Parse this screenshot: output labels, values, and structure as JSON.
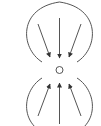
{
  "diagram": {
    "title": "",
    "colors": {
      "stroke": "#555555",
      "background": "#ffffff"
    },
    "center": {
      "x": 59.5,
      "y": 70,
      "r": 3.5
    },
    "top_lobe": {
      "path": "M 42 62 C 20 48, 18 8, 59.5 2 C 101 8, 99 48, 77 62",
      "arrows": [
        {
          "x1": 38,
          "y1": 24,
          "x2": 50,
          "y2": 57
        },
        {
          "x1": 59.5,
          "y1": 18,
          "x2": 59.5,
          "y2": 58
        },
        {
          "x1": 81,
          "y1": 24,
          "x2": 69,
          "y2": 57
        }
      ]
    },
    "bottom_lobe": {
      "path": "M 42 78 C 20 92, 18 132, 59.5 138 C 101 132, 99 92, 77 78",
      "arrows": [
        {
          "x1": 38,
          "y1": 116,
          "x2": 50,
          "y2": 84
        },
        {
          "x1": 59.5,
          "y1": 124,
          "x2": 59.5,
          "y2": 83
        },
        {
          "x1": 81,
          "y1": 116,
          "x2": 69,
          "y2": 84
        }
      ]
    }
  }
}
